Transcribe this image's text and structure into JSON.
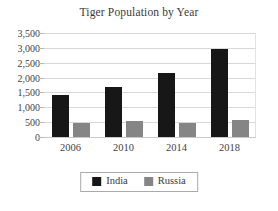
{
  "chart_data": {
    "type": "bar",
    "title": "Tiger Population by Year",
    "xlabel": "",
    "ylabel": "",
    "categories": [
      "2006",
      "2010",
      "2014",
      "2018"
    ],
    "series": [
      {
        "name": "India",
        "color": "#171717",
        "values": [
          1430,
          1700,
          2150,
          2950
        ]
      },
      {
        "name": "Russia",
        "color": "#858585",
        "values": [
          480,
          530,
          480,
          560
        ]
      }
    ],
    "ylim": [
      0,
      3500
    ],
    "ytick_values": [
      0,
      500,
      1000,
      1500,
      2000,
      2500,
      3000,
      3500
    ],
    "ytick_labels": [
      "0",
      "500",
      "1,000",
      "1,500",
      "2,000",
      "2,500",
      "3,000",
      "3,500"
    ],
    "grid": true,
    "grid_axis": "y",
    "legend_position": "bottom",
    "legend_entries": [
      "India",
      "Russia"
    ]
  },
  "colors": {
    "india": "#171717",
    "russia": "#858585",
    "gridline": "#d8d8d8",
    "text": "#3a3a3a",
    "legend_border": "#aaaaaa",
    "background": "#ffffff"
  }
}
